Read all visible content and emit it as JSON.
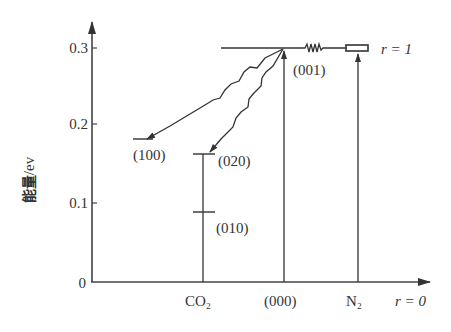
{
  "diagram": {
    "type": "energy-level-diagram",
    "y_axis": {
      "label": "能量",
      "unit": "/ev",
      "ticks": [
        "0",
        "0.1",
        "0.2",
        "0.3"
      ]
    },
    "x_axis": {
      "labels": [
        "CO₂",
        "(000)",
        "N₂"
      ],
      "end_label": "r = 0"
    },
    "top_level_label": "r = 1",
    "levels": {
      "l001": "(001)",
      "l100": "(100)",
      "l020": "(020)",
      "l010": "(010)"
    },
    "colors": {
      "line": "#333333",
      "background": "#ffffff"
    }
  }
}
